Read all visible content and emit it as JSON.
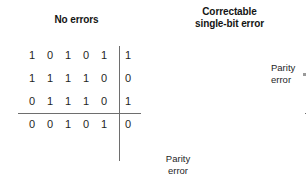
{
  "figure": {
    "caption_left": "No errors",
    "caption_right_line1": "Correctable",
    "caption_right_line2": "single-bit error"
  },
  "colors": {
    "text": "#1f1f1f",
    "rule": "#6e6e6e",
    "arrow": "#9a9a9a",
    "error_bit": "#6a6a6a"
  },
  "panels": [
    {
      "id": "no-errors",
      "title": "No errors",
      "grid": {
        "rows": 4,
        "cols": 6,
        "data_cols": 5,
        "parity_col_index": 5,
        "parity_row_index": 3,
        "cells": [
          [
            "1",
            "0",
            "1",
            "0",
            "1",
            "1"
          ],
          [
            "1",
            "1",
            "1",
            "1",
            "0",
            "0"
          ],
          [
            "0",
            "1",
            "1",
            "1",
            "0",
            "1"
          ],
          [
            "0",
            "0",
            "1",
            "0",
            "1",
            "0"
          ]
        ]
      },
      "error": null
    },
    {
      "id": "correctable-single-bit-error",
      "title": "Correctable single-bit error",
      "grid": {
        "rows": 4,
        "cols": 6,
        "data_cols": 5,
        "parity_col_index": 5,
        "parity_row_index": 3,
        "cells": [
          [
            "1",
            "0",
            "1",
            "0",
            "1",
            "1"
          ],
          [
            "1",
            "0",
            "1",
            "1",
            "0",
            "0"
          ],
          [
            "0",
            "1",
            "1",
            "1",
            "0",
            "1"
          ],
          [
            "0",
            "0",
            "1",
            "0",
            "1",
            "0"
          ]
        ]
      },
      "error": {
        "row_index": 1,
        "col_index": 1,
        "row_label_line1": "Parity",
        "row_label_line2": "error",
        "col_label_line1": "Parity",
        "col_label_line2": "error"
      }
    }
  ]
}
